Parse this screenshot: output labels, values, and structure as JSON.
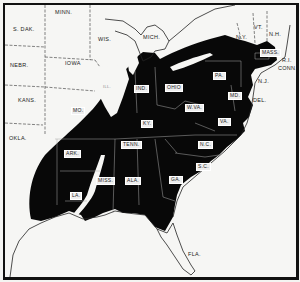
{
  "map": {
    "title": "",
    "colors": {
      "range_fill": "#080808",
      "land": "#f6f6f4",
      "border": "#111111",
      "label_box": "#eeeeee"
    },
    "outside_labels": [
      {
        "id": "sdak",
        "text": "S. DAK.",
        "x": 8,
        "y": 26
      },
      {
        "id": "minn",
        "text": "MINN.",
        "x": 52,
        "y": 8
      },
      {
        "id": "wis",
        "text": "WIS.",
        "x": 95,
        "y": 35
      },
      {
        "id": "mich",
        "text": "MICH.",
        "x": 140,
        "y": 33
      },
      {
        "id": "nebr",
        "text": "NEBR.",
        "x": 6,
        "y": 62
      },
      {
        "id": "iowa",
        "text": "IOWA",
        "x": 61,
        "y": 59
      },
      {
        "id": "ill",
        "text": "ILL.",
        "x": 100,
        "y": 84
      },
      {
        "id": "kans",
        "text": "KANS.",
        "x": 14,
        "y": 97
      },
      {
        "id": "okla",
        "text": "OKLA.",
        "x": 5,
        "y": 135
      },
      {
        "id": "ny",
        "text": "N.Y.",
        "x": 233,
        "y": 33
      },
      {
        "id": "vt",
        "text": "VT.",
        "x": 251,
        "y": 23
      },
      {
        "id": "nh",
        "text": "N.H.",
        "x": 266,
        "y": 30
      },
      {
        "id": "ri",
        "text": "R.I.",
        "x": 279,
        "y": 56
      },
      {
        "id": "conn",
        "text": "CONN.",
        "x": 277,
        "y": 64
      },
      {
        "id": "nj",
        "text": "N.J.",
        "x": 255,
        "y": 77
      },
      {
        "id": "del",
        "text": "DEL.",
        "x": 250,
        "y": 96
      },
      {
        "id": "fla",
        "text": "FLA.",
        "x": 185,
        "y": 250
      }
    ],
    "range_labels": [
      {
        "id": "mass",
        "text": "MASS.",
        "x": 258,
        "y": 47
      },
      {
        "id": "pa",
        "text": "PA.",
        "x": 210,
        "y": 70
      },
      {
        "id": "ind",
        "text": "IND.",
        "x": 131,
        "y": 83
      },
      {
        "id": "ohio",
        "text": "OHIO",
        "x": 163,
        "y": 82
      },
      {
        "id": "mo",
        "text": "MO.",
        "x": 68,
        "y": 105
      },
      {
        "id": "wva",
        "text": "W.VA.",
        "x": 183,
        "y": 102
      },
      {
        "id": "md",
        "text": "MD.",
        "x": 225,
        "y": 90
      },
      {
        "id": "ky",
        "text": "KY.",
        "x": 138,
        "y": 118
      },
      {
        "id": "va",
        "text": "VA.",
        "x": 215,
        "y": 116
      },
      {
        "id": "tenn",
        "text": "TENN.",
        "x": 118,
        "y": 139
      },
      {
        "id": "nc",
        "text": "N.C.",
        "x": 195,
        "y": 139
      },
      {
        "id": "ark",
        "text": "ARK.",
        "x": 61,
        "y": 148
      },
      {
        "id": "sc",
        "text": "S.C.",
        "x": 193,
        "y": 161
      },
      {
        "id": "ga",
        "text": "GA.",
        "x": 166,
        "y": 174
      },
      {
        "id": "miss",
        "text": "MISS.",
        "x": 94,
        "y": 175
      },
      {
        "id": "ala",
        "text": "ALA.",
        "x": 122,
        "y": 175
      },
      {
        "id": "la",
        "text": "LA.",
        "x": 67,
        "y": 190
      }
    ]
  }
}
